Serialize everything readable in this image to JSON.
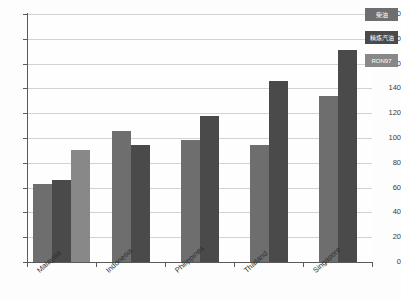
{
  "chart_data": {
    "type": "bar",
    "title": "",
    "xlabel": "",
    "ylabel": "",
    "ylim": [
      0,
      200
    ],
    "ytick_step": 20,
    "grid": true,
    "legend_position": "top-right",
    "categories": [
      "Malaysia",
      "Indonesia",
      "Philippines",
      "Thailand",
      "Singapore"
    ],
    "yticks": [
      "0",
      "20",
      "40",
      "60",
      "80",
      "100",
      "120",
      "140",
      "160",
      "180",
      "200"
    ],
    "series": [
      {
        "name": "柴油",
        "color": "#6e6e6e",
        "values": [
          63,
          106,
          98,
          94,
          134
        ]
      },
      {
        "name": "精炼汽油",
        "color": "#4a4a4a",
        "values": [
          66,
          94,
          118,
          146,
          171
        ]
      },
      {
        "name": "RON97",
        "color": "#888888",
        "values": [
          90,
          null,
          null,
          null,
          null
        ]
      }
    ]
  },
  "legend": {
    "items": [
      {
        "label": "柴油"
      },
      {
        "label": "精炼汽油"
      },
      {
        "label": "RON97"
      }
    ]
  }
}
